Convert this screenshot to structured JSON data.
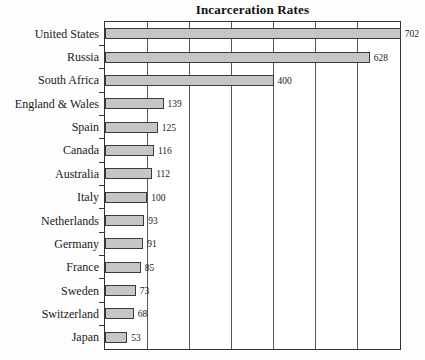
{
  "chart_data": {
    "type": "bar",
    "orientation": "horizontal",
    "title": "Incarceration Rates",
    "xlabel": "",
    "ylabel": "",
    "categories": [
      "United States",
      "Russia",
      "South Africa",
      "England & Wales",
      "Spain",
      "Canada",
      "Australia",
      "Italy",
      "Netherlands",
      "Germany",
      "France",
      "Sweden",
      "Switzerland",
      "Japan"
    ],
    "values": [
      702,
      628,
      400,
      139,
      125,
      116,
      112,
      100,
      93,
      91,
      85,
      73,
      68,
      53
    ],
    "value_labels": [
      "702",
      "628",
      "400",
      "139",
      "125",
      "116",
      "112",
      "100",
      "93",
      "91",
      "85",
      "73",
      "68",
      "53"
    ],
    "xlim": [
      0,
      700
    ],
    "grid_step": 100,
    "grid": true,
    "legend": false,
    "colors": {
      "bar_fill": "#c6c6c6",
      "bar_border": "#3a3a3a",
      "gridline": "#555555",
      "axis": "#333333",
      "text": "#1a1a1a"
    }
  }
}
